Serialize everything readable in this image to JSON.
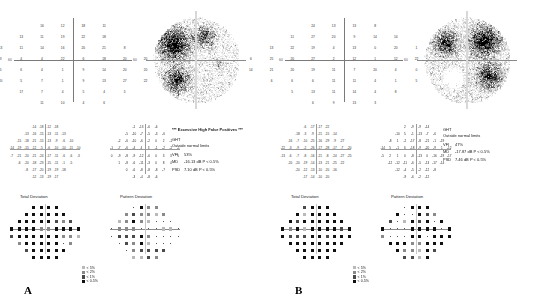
{
  "report": {
    "type": "humphrey-visual-field-printout",
    "panels": [
      {
        "id": "A",
        "letter": "A",
        "sensitivity_grid": {
          "rows": [
            {
              "y": 3,
              "values": [
                "16",
                "12",
                "18",
                "11"
              ],
              "xs": [
                -9,
                -3,
                3,
                9
              ]
            },
            {
              "y": 2,
              "values": [
                "13",
                "11",
                "19",
                "22",
                "18"
              ],
              "xs": [
                -15,
                -9,
                -3,
                3,
                9
              ]
            },
            {
              "y": 1,
              "values": [
                "13",
                "11",
                "14",
                "16",
                "20",
                "21",
                "8"
              ],
              "xs": [
                -21,
                -15,
                -9,
                -3,
                3,
                9,
                15
              ]
            },
            {
              "y": 0,
              "values": [
                "3",
                "3",
                "4",
                "4",
                "22",
                "6",
                "18",
                "20",
                "20",
                "24"
              ],
              "xs": [
                -27,
                -21,
                -15,
                -9,
                -3,
                3,
                9,
                15,
                21,
                27
              ]
            },
            {
              "y": -1,
              "values": [
                "20",
                "5",
                "6",
                "4",
                "1",
                "9",
                "14",
                "20",
                "20",
                "25"
              ],
              "xs": [
                -27,
                -21,
                -15,
                -9,
                -3,
                3,
                9,
                15,
                21,
                27
              ]
            },
            {
              "y": -2,
              "values": [
                "20",
                "5",
                "7",
                "1",
                "9",
                "13",
                "27",
                "22"
              ],
              "xs": [
                -21,
                -15,
                -9,
                -3,
                3,
                9,
                15,
                21
              ]
            },
            {
              "y": -3,
              "values": [
                "17",
                "7",
                "4",
                "5",
                "4",
                "5"
              ],
              "xs": [
                -15,
                -9,
                -3,
                3,
                9,
                15
              ]
            },
            {
              "y": -4,
              "values": [
                "11",
                "10",
                "4",
                "6"
              ],
              "xs": [
                -9,
                -3,
                3,
                9
              ]
            }
          ],
          "axis_label_left": "60",
          "axis_label_right": "60"
        },
        "grayscale_label": "grayscale-map",
        "total_deviation": {
          "title": "Total Deviation",
          "rows": [
            {
              "y": 3,
              "values": [
                "-14",
                "-18",
                "-12",
                "-18"
              ]
            },
            {
              "y": 2,
              "values": [
                "-13",
                "-16",
                "-15",
                "-13",
                "-11",
                "-13"
              ]
            },
            {
              "y": 1,
              "values": [
                "-15",
                "-18",
                "-21",
                "-15",
                "-13",
                "-9",
                "-6",
                "-10"
              ]
            },
            {
              "y": 0,
              "values": [
                "-14",
                "-19",
                "-15",
                "-12",
                "-5",
                "-6",
                "-10",
                "-10",
                "-11",
                "-10"
              ]
            },
            {
              "y": -1,
              "values": [
                "-7",
                "-21",
                "-20",
                "-21",
                "-24",
                "-17",
                "-11",
                "-6",
                "-6",
                "-3"
              ]
            },
            {
              "y": -2,
              "values": [
                "-6",
                "-20",
                "-18",
                "-23",
                "-15",
                "-11",
                "-1",
                "-5"
              ]
            },
            {
              "y": -3,
              "values": [
                "-8",
                "-17",
                "-20",
                "-19",
                "-19",
                "-18"
              ]
            },
            {
              "y": -4,
              "values": [
                "-12",
                "-13",
                "-19",
                "-17"
              ]
            }
          ]
        },
        "pattern_deviation": {
          "title": "Pattern Deviation",
          "rows": [
            {
              "y": 3,
              "values": [
                "-1",
                "-13",
                "-6",
                "-6"
              ]
            },
            {
              "y": 2,
              "values": [
                "-5",
                "-10",
                "-7",
                "-5",
                "-3",
                "-6"
              ]
            },
            {
              "y": 1,
              "values": [
                "-2",
                "-6",
                "-10",
                "-6",
                "-2",
                "0",
                "2",
                "-1"
              ]
            },
            {
              "y": 0,
              "values": [
                "-1",
                "-7",
                "-6",
                "-4",
                "4",
                "3",
                "-1",
                "-2",
                "-2",
                "-1"
              ]
            },
            {
              "y": -1,
              "values": [
                "0",
                "-9",
                "-8",
                "-9",
                "-12",
                "-6",
                "0",
                "3",
                "3",
                "5"
              ]
            },
            {
              "y": -2,
              "values": [
                "1",
                "-8",
                "-6",
                "-11",
                "-3",
                "0",
                "8",
                "4"
              ]
            },
            {
              "y": -3,
              "values": [
                "0",
                "-6",
                "-8",
                "-8",
                "-8",
                "-7"
              ]
            },
            {
              "y": -4,
              "values": [
                "-3",
                "-4",
                "-8",
                "-6"
              ]
            }
          ]
        },
        "reliability": {
          "warning": "*** Excessive High False Positives ***",
          "ght_label": "GHT",
          "ght_value": "Outside normal limits",
          "vfi_label": "VFI",
          "vfi_value": "53%",
          "md_label": "MD",
          "md_value": "-16.13 dB  P < 0.5%",
          "psd_label": "PSD",
          "psd_value": "7.10 dB  P < 0.5%"
        },
        "legend": {
          "rows": [
            {
              "level": "p-5",
              "label": "< 5%"
            },
            {
              "level": "p-2",
              "label": "< 2%"
            },
            {
              "level": "p-1",
              "label": "< 1%"
            },
            {
              "level": "p-05",
              "label": "< 0.5%"
            }
          ]
        }
      },
      {
        "id": "B",
        "letter": "B",
        "sensitivity_grid": {
          "rows": [
            {
              "y": 3,
              "values": [
                "24",
                "13",
                "13",
                "8"
              ],
              "xs": [
                -9,
                -3,
                3,
                9
              ]
            },
            {
              "y": 2,
              "values": [
                "11",
                "27",
                "20",
                "9",
                "14",
                "14"
              ],
              "xs": [
                -15,
                -9,
                -3,
                3,
                9,
                15
              ]
            },
            {
              "y": 1,
              "values": [
                "13",
                "22",
                "19",
                "4",
                "13",
                "0",
                "20",
                "1"
              ],
              "xs": [
                -21,
                -15,
                -9,
                -3,
                3,
                9,
                15,
                21
              ]
            },
            {
              "y": 0,
              "values": [
                "6",
                "25",
                "20",
                "27",
                "2",
                "12",
                "1",
                "12",
                "22",
                "8"
              ],
              "xs": [
                -27,
                -21,
                -15,
                -9,
                -3,
                3,
                9,
                15,
                21,
                27
              ]
            },
            {
              "y": -1,
              "values": [
                "14",
                "21",
                "20",
                "19",
                "11",
                "7",
                "20",
                "4",
                "0",
                "3"
              ],
              "xs": [
                -27,
                -21,
                -15,
                -9,
                -3,
                3,
                9,
                15,
                21,
                27
              ]
            },
            {
              "y": -2,
              "values": [
                "6",
                "6",
                "6",
                "11",
                "11",
                "4",
                "1",
                "5"
              ],
              "xs": [
                -21,
                -15,
                -9,
                -3,
                3,
                9,
                15,
                21
              ]
            },
            {
              "y": -3,
              "values": [
                "5",
                "13",
                "11",
                "14",
                "4",
                "8"
              ],
              "xs": [
                -15,
                -9,
                -3,
                3,
                9,
                15
              ]
            },
            {
              "y": -4,
              "values": [
                "6",
                "9",
                "13",
                "3"
              ],
              "xs": [
                -9,
                -3,
                3,
                9
              ]
            }
          ],
          "axis_label_left": "60",
          "axis_label_right": "60"
        },
        "grayscale_label": "grayscale-map",
        "total_deviation": {
          "title": "Total Deviation",
          "rows": [
            {
              "y": 3,
              "values": [
                "-6",
                "-17",
                "-17",
                "-22"
              ]
            },
            {
              "y": 2,
              "values": [
                "-18",
                "-3",
                "-9",
                "-21",
                "-15",
                "-14"
              ]
            },
            {
              "y": 1,
              "values": [
                "-16",
                "-7",
                "-10",
                "-25",
                "-16",
                "-29",
                "-9",
                "-27"
              ]
            },
            {
              "y": 0,
              "values": [
                "-22",
                "-3",
                "-9",
                "-2",
                "-26",
                "-17",
                "-28",
                "-17",
                "-7",
                "-20"
              ]
            },
            {
              "y": -1,
              "values": [
                "-13",
                "-6",
                "-7",
                "-8",
                "-16",
                "-21",
                "-8",
                "-24",
                "-27",
                "-25"
              ]
            },
            {
              "y": -2,
              "values": [
                "-20",
                "-20",
                "-19",
                "-14",
                "-13",
                "-21",
                "-25",
                "-22"
              ]
            },
            {
              "y": -3,
              "values": [
                "-20",
                "-12",
                "-13",
                "-10",
                "-20",
                "-16"
              ]
            },
            {
              "y": -4,
              "values": [
                "-17",
                "-14",
                "-10",
                "-20"
              ]
            }
          ]
        },
        "pattern_deviation": {
          "title": "Pattern Deviation",
          "rows": [
            {
              "y": 3,
              "values": [
                "2",
                "-9",
                "-9",
                "-14"
              ]
            },
            {
              "y": 2,
              "values": [
                "-10",
                "5",
                "-1",
                "-13",
                "-7",
                "-6"
              ]
            },
            {
              "y": 1,
              "values": [
                "-8",
                "1",
                "-2",
                "-17",
                "-8",
                "-21",
                "-1",
                "-19"
              ]
            },
            {
              "y": 0,
              "values": [
                "-14",
                "5",
                "-1",
                "6",
                "-18",
                "-9",
                "-20",
                "-9",
                "1",
                "-12"
              ]
            },
            {
              "y": -1,
              "values": [
                "-5",
                "2",
                "1",
                "0",
                "-8",
                "-13",
                "0",
                "-16",
                "-19",
                "-17"
              ]
            },
            {
              "y": -2,
              "values": [
                "-12",
                "-12",
                "-11",
                "-6",
                "-5",
                "-13",
                "-17",
                "-14"
              ]
            },
            {
              "y": -3,
              "values": [
                "-12",
                "-4",
                "-5",
                "-2",
                "-12",
                "-8"
              ]
            },
            {
              "y": -4,
              "values": [
                "-9",
                "-6",
                "-2",
                "-12"
              ]
            }
          ]
        },
        "reliability": {
          "warning": "",
          "ght_label": "GHT",
          "ght_value": "Outside normal limits",
          "vfi_label": "VFI",
          "vfi_value": "47%",
          "md_label": "MD",
          "md_value": "-17.87 dB  P < 0.5%",
          "psd_label": "PSD",
          "psd_value": "7.46 dB  P < 0.5%"
        },
        "legend": {
          "rows": [
            {
              "level": "p-5",
              "label": "< 5%"
            },
            {
              "level": "p-2",
              "label": "< 2%"
            },
            {
              "level": "p-1",
              "label": "< 1%"
            },
            {
              "level": "p-05",
              "label": "< 0.5%"
            }
          ]
        }
      }
    ]
  }
}
